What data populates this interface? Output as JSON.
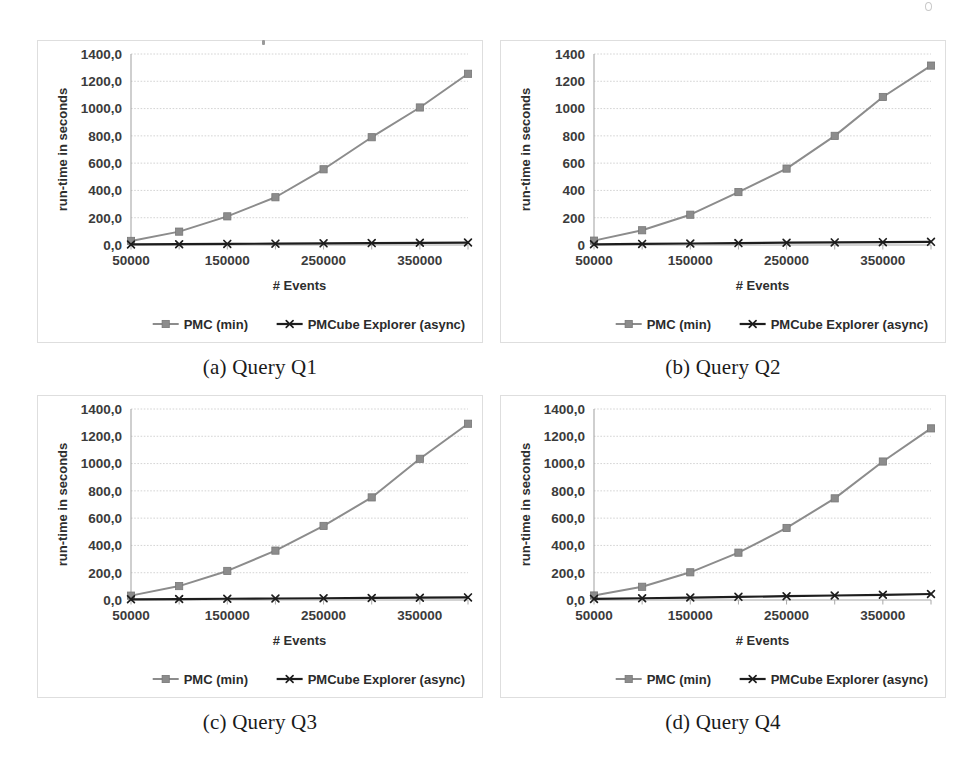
{
  "figure": {
    "panels": [
      {
        "id": "a",
        "caption": "(a) Query Q1",
        "chart_data": {
          "type": "line",
          "title": "",
          "xlabel": "# Events",
          "ylabel": "run-time in seconds",
          "x": [
            50000,
            100000,
            150000,
            200000,
            250000,
            300000,
            350000,
            400000
          ],
          "xtick_labels": [
            "50000",
            "",
            "150000",
            "",
            "250000",
            "",
            "350000",
            ""
          ],
          "ytick_labels": [
            "0,0",
            "200,0",
            "400,0",
            "600,0",
            "800,0",
            "1000,0",
            "1200,0",
            "1400,0"
          ],
          "ytick_values": [
            0,
            200,
            400,
            600,
            800,
            1000,
            1200,
            1400
          ],
          "ylim": [
            0,
            1400
          ],
          "grid": true,
          "legend_position": "bottom",
          "series": [
            {
              "name": "PMC (min)",
              "marker": "square",
              "color": "#8c8c8c",
              "values": [
                30,
                98,
                210,
                350,
                555,
                790,
                1008,
                1255
              ]
            },
            {
              "name": "PMCube Explorer (async)",
              "marker": "x",
              "color": "#1d1d1d",
              "values": [
                4,
                6,
                8,
                10,
                12,
                14,
                16,
                18
              ]
            }
          ]
        }
      },
      {
        "id": "b",
        "caption": "(b) Query Q2",
        "chart_data": {
          "type": "line",
          "title": "",
          "xlabel": "# Events",
          "ylabel": "run-time in seconds",
          "x": [
            50000,
            100000,
            150000,
            200000,
            250000,
            300000,
            350000,
            400000
          ],
          "xtick_labels": [
            "50000",
            "",
            "150000",
            "",
            "250000",
            "",
            "350000",
            ""
          ],
          "ytick_labels": [
            "0",
            "200",
            "400",
            "600",
            "800",
            "1000",
            "1200",
            "1400"
          ],
          "ytick_values": [
            0,
            200,
            400,
            600,
            800,
            1000,
            1200,
            1400
          ],
          "ylim": [
            0,
            1400
          ],
          "grid": true,
          "legend_position": "bottom",
          "series": [
            {
              "name": "PMC (min)",
              "marker": "square",
              "color": "#8c8c8c",
              "values": [
                32,
                108,
                222,
                388,
                560,
                800,
                1085,
                1315
              ]
            },
            {
              "name": "PMCube Explorer (async)",
              "marker": "x",
              "color": "#1d1d1d",
              "values": [
                5,
                8,
                11,
                14,
                17,
                19,
                21,
                23
              ]
            }
          ]
        }
      },
      {
        "id": "c",
        "caption": "(c) Query Q3",
        "chart_data": {
          "type": "line",
          "title": "",
          "xlabel": "# Events",
          "ylabel": "run-time in seconds",
          "x": [
            50000,
            100000,
            150000,
            200000,
            250000,
            300000,
            350000,
            400000
          ],
          "xtick_labels": [
            "50000",
            "",
            "150000",
            "",
            "250000",
            "",
            "350000",
            ""
          ],
          "ytick_labels": [
            "0,0",
            "200,0",
            "400,0",
            "600,0",
            "800,0",
            "1000,0",
            "1200,0",
            "1400,0"
          ],
          "ytick_values": [
            0,
            200,
            400,
            600,
            800,
            1000,
            1200,
            1400
          ],
          "ylim": [
            0,
            1400
          ],
          "grid": true,
          "legend_position": "bottom",
          "series": [
            {
              "name": "PMC (min)",
              "marker": "square",
              "color": "#8c8c8c",
              "values": [
                32,
                102,
                213,
                362,
                543,
                752,
                1035,
                1292
              ]
            },
            {
              "name": "PMCube Explorer (async)",
              "marker": "x",
              "color": "#1d1d1d",
              "values": [
                5,
                7,
                9,
                11,
                13,
                15,
                17,
                19
              ]
            }
          ]
        }
      },
      {
        "id": "d",
        "caption": "(d) Query Q4",
        "chart_data": {
          "type": "line",
          "title": "",
          "xlabel": "# Events",
          "ylabel": "run-time in seconds",
          "x": [
            50000,
            100000,
            150000,
            200000,
            250000,
            300000,
            350000,
            400000
          ],
          "xtick_labels": [
            "50000",
            "",
            "150000",
            "",
            "250000",
            "",
            "350000",
            ""
          ],
          "ytick_labels": [
            "0,0",
            "200,0",
            "400,0",
            "600,0",
            "800,0",
            "1000,0",
            "1200,0",
            "1400,0"
          ],
          "ytick_values": [
            0,
            200,
            400,
            600,
            800,
            1000,
            1200,
            1400
          ],
          "ylim": [
            0,
            1400
          ],
          "grid": true,
          "legend_position": "bottom",
          "series": [
            {
              "name": "PMC (min)",
              "marker": "square",
              "color": "#8c8c8c",
              "values": [
                33,
                97,
                203,
                347,
                528,
                745,
                1015,
                1258
              ]
            },
            {
              "name": "PMCube Explorer (async)",
              "marker": "x",
              "color": "#1d1d1d",
              "values": [
                8,
                13,
                18,
                23,
                28,
                33,
                38,
                44
              ]
            }
          ]
        }
      }
    ]
  },
  "colors": {
    "pmc_series": "#8c8c8c",
    "pmcube_series": "#1d1d1d",
    "gridline": "#cfcfcf",
    "axis": "#a8a8a8",
    "panel_border": "#dedede",
    "text": "#2e2e2e",
    "background": "#ffffff"
  }
}
